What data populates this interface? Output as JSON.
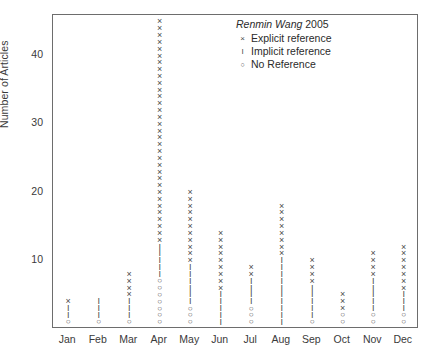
{
  "chart_data": {
    "type": "scatter",
    "title": "",
    "xlabel": "",
    "ylabel": "Number of Articles",
    "ylim": [
      0,
      46
    ],
    "yticks": [
      10,
      20,
      30,
      40
    ],
    "grid": false,
    "legend_position": "top-right",
    "legend": {
      "title_italic": "Renmin Wang",
      "title_year": "2005",
      "entries": [
        {
          "symbol": "x",
          "label": "Explicit reference"
        },
        {
          "symbol": "I",
          "label": "Implicit reference"
        },
        {
          "symbol": "o",
          "label": "No Reference"
        }
      ]
    },
    "categories": [
      "Jan",
      "Feb",
      "Mar",
      "Apr",
      "May",
      "Jun",
      "Jul",
      "Aug",
      "Sep",
      "Oct",
      "Nov",
      "Dec"
    ],
    "series": [
      {
        "name": "Explicit reference",
        "symbol": "x",
        "values": [
          1,
          0,
          4,
          33,
          11,
          9,
          4,
          9,
          4,
          3,
          4,
          8
        ]
      },
      {
        "name": "Implicit reference",
        "symbol": "I",
        "values": [
          2,
          3,
          3,
          5,
          6,
          5,
          4,
          10,
          5,
          0,
          5,
          3
        ]
      },
      {
        "name": "No Reference",
        "symbol": "o",
        "values": [
          1,
          1,
          1,
          7,
          3,
          0,
          3,
          0,
          1,
          2,
          2,
          2
        ]
      }
    ],
    "stacks": {
      "Jan": [
        {
          "v": 1,
          "s": "o"
        },
        {
          "v": 2,
          "s": "I"
        },
        {
          "v": 3,
          "s": "I"
        },
        {
          "v": 4,
          "s": "x"
        }
      ],
      "Feb": [
        {
          "v": 1,
          "s": "o"
        },
        {
          "v": 2,
          "s": "I"
        },
        {
          "v": 3,
          "s": "I"
        },
        {
          "v": 4,
          "s": "I"
        }
      ],
      "Mar": [
        {
          "v": 1,
          "s": "o"
        },
        {
          "v": 2,
          "s": "I"
        },
        {
          "v": 3,
          "s": "I"
        },
        {
          "v": 4,
          "s": "I"
        },
        {
          "v": 5,
          "s": "x"
        },
        {
          "v": 6,
          "s": "x"
        },
        {
          "v": 7,
          "s": "x"
        },
        {
          "v": 8,
          "s": "x"
        }
      ],
      "Apr": [
        {
          "v": 1,
          "s": "o"
        },
        {
          "v": 2,
          "s": "o"
        },
        {
          "v": 3,
          "s": "o"
        },
        {
          "v": 4,
          "s": "o"
        },
        {
          "v": 5,
          "s": "o"
        },
        {
          "v": 6,
          "s": "o"
        },
        {
          "v": 7,
          "s": "o"
        },
        {
          "v": 8,
          "s": "I"
        },
        {
          "v": 9,
          "s": "I"
        },
        {
          "v": 10,
          "s": "I"
        },
        {
          "v": 11,
          "s": "I"
        },
        {
          "v": 12,
          "s": "I"
        },
        {
          "v": 13,
          "s": "x"
        },
        {
          "v": 14,
          "s": "x"
        },
        {
          "v": 15,
          "s": "x"
        },
        {
          "v": 16,
          "s": "x"
        },
        {
          "v": 17,
          "s": "x"
        },
        {
          "v": 18,
          "s": "x"
        },
        {
          "v": 19,
          "s": "x"
        },
        {
          "v": 20,
          "s": "x"
        },
        {
          "v": 21,
          "s": "x"
        },
        {
          "v": 22,
          "s": "x"
        },
        {
          "v": 23,
          "s": "x"
        },
        {
          "v": 24,
          "s": "x"
        },
        {
          "v": 25,
          "s": "x"
        },
        {
          "v": 26,
          "s": "x"
        },
        {
          "v": 27,
          "s": "x"
        },
        {
          "v": 28,
          "s": "x"
        },
        {
          "v": 29,
          "s": "x"
        },
        {
          "v": 30,
          "s": "x"
        },
        {
          "v": 31,
          "s": "x"
        },
        {
          "v": 32,
          "s": "x"
        },
        {
          "v": 33,
          "s": "x"
        },
        {
          "v": 34,
          "s": "x"
        },
        {
          "v": 35,
          "s": "x"
        },
        {
          "v": 36,
          "s": "x"
        },
        {
          "v": 37,
          "s": "x"
        },
        {
          "v": 38,
          "s": "x"
        },
        {
          "v": 39,
          "s": "x"
        },
        {
          "v": 40,
          "s": "x"
        },
        {
          "v": 41,
          "s": "x"
        },
        {
          "v": 42,
          "s": "x"
        },
        {
          "v": 43,
          "s": "x"
        },
        {
          "v": 44,
          "s": "x"
        },
        {
          "v": 45,
          "s": "x"
        }
      ],
      "May": [
        {
          "v": 1,
          "s": "o"
        },
        {
          "v": 2,
          "s": "o"
        },
        {
          "v": 3,
          "s": "o"
        },
        {
          "v": 4,
          "s": "I"
        },
        {
          "v": 5,
          "s": "I"
        },
        {
          "v": 6,
          "s": "I"
        },
        {
          "v": 7,
          "s": "I"
        },
        {
          "v": 8,
          "s": "I"
        },
        {
          "v": 9,
          "s": "I"
        },
        {
          "v": 10,
          "s": "x"
        },
        {
          "v": 11,
          "s": "x"
        },
        {
          "v": 12,
          "s": "x"
        },
        {
          "v": 13,
          "s": "x"
        },
        {
          "v": 14,
          "s": "x"
        },
        {
          "v": 15,
          "s": "x"
        },
        {
          "v": 16,
          "s": "x"
        },
        {
          "v": 17,
          "s": "x"
        },
        {
          "v": 18,
          "s": "x"
        },
        {
          "v": 19,
          "s": "x"
        },
        {
          "v": 20,
          "s": "x"
        }
      ],
      "Jun": [
        {
          "v": 1,
          "s": "I"
        },
        {
          "v": 2,
          "s": "I"
        },
        {
          "v": 3,
          "s": "I"
        },
        {
          "v": 4,
          "s": "I"
        },
        {
          "v": 5,
          "s": "I"
        },
        {
          "v": 6,
          "s": "x"
        },
        {
          "v": 7,
          "s": "x"
        },
        {
          "v": 8,
          "s": "x"
        },
        {
          "v": 9,
          "s": "x"
        },
        {
          "v": 10,
          "s": "x"
        },
        {
          "v": 11,
          "s": "x"
        },
        {
          "v": 12,
          "s": "x"
        },
        {
          "v": 13,
          "s": "x"
        },
        {
          "v": 14,
          "s": "x"
        }
      ],
      "Jul": [
        {
          "v": 1,
          "s": "o"
        },
        {
          "v": 2,
          "s": "o"
        },
        {
          "v": 3,
          "s": "o"
        },
        {
          "v": 4,
          "s": "I"
        },
        {
          "v": 5,
          "s": "I"
        },
        {
          "v": 6,
          "s": "I"
        },
        {
          "v": 7,
          "s": "I"
        },
        {
          "v": 8,
          "s": "x"
        },
        {
          "v": 9,
          "s": "x"
        }
      ],
      "Aug": [
        {
          "v": 1,
          "s": "I"
        },
        {
          "v": 2,
          "s": "I"
        },
        {
          "v": 3,
          "s": "I"
        },
        {
          "v": 4,
          "s": "I"
        },
        {
          "v": 5,
          "s": "I"
        },
        {
          "v": 6,
          "s": "I"
        },
        {
          "v": 7,
          "s": "I"
        },
        {
          "v": 8,
          "s": "I"
        },
        {
          "v": 9,
          "s": "I"
        },
        {
          "v": 10,
          "s": "I"
        },
        {
          "v": 11,
          "s": "x"
        },
        {
          "v": 12,
          "s": "x"
        },
        {
          "v": 13,
          "s": "x"
        },
        {
          "v": 14,
          "s": "x"
        },
        {
          "v": 15,
          "s": "x"
        },
        {
          "v": 16,
          "s": "x"
        },
        {
          "v": 17,
          "s": "x"
        },
        {
          "v": 18,
          "s": "x"
        }
      ],
      "Sep": [
        {
          "v": 1,
          "s": "o"
        },
        {
          "v": 2,
          "s": "I"
        },
        {
          "v": 3,
          "s": "I"
        },
        {
          "v": 4,
          "s": "I"
        },
        {
          "v": 5,
          "s": "I"
        },
        {
          "v": 6,
          "s": "I"
        },
        {
          "v": 7,
          "s": "x"
        },
        {
          "v": 8,
          "s": "x"
        },
        {
          "v": 9,
          "s": "x"
        },
        {
          "v": 10,
          "s": "x"
        }
      ],
      "Oct": [
        {
          "v": 1,
          "s": "o"
        },
        {
          "v": 2,
          "s": "o"
        },
        {
          "v": 3,
          "s": "x"
        },
        {
          "v": 4,
          "s": "x"
        },
        {
          "v": 5,
          "s": "x"
        }
      ],
      "Nov": [
        {
          "v": 1,
          "s": "o"
        },
        {
          "v": 2,
          "s": "o"
        },
        {
          "v": 3,
          "s": "I"
        },
        {
          "v": 4,
          "s": "I"
        },
        {
          "v": 5,
          "s": "I"
        },
        {
          "v": 6,
          "s": "I"
        },
        {
          "v": 7,
          "s": "I"
        },
        {
          "v": 8,
          "s": "x"
        },
        {
          "v": 9,
          "s": "x"
        },
        {
          "v": 10,
          "s": "x"
        },
        {
          "v": 11,
          "s": "x"
        }
      ],
      "Dec": [
        {
          "v": 1,
          "s": "o"
        },
        {
          "v": 2,
          "s": "o"
        },
        {
          "v": 3,
          "s": "I"
        },
        {
          "v": 4,
          "s": "I"
        },
        {
          "v": 5,
          "s": "I"
        },
        {
          "v": 6,
          "s": "x"
        },
        {
          "v": 7,
          "s": "x"
        },
        {
          "v": 8,
          "s": "x"
        },
        {
          "v": 9,
          "s": "x"
        },
        {
          "v": 10,
          "s": "x"
        },
        {
          "v": 11,
          "s": "x"
        },
        {
          "v": 12,
          "s": "x"
        }
      ]
    }
  },
  "symbols": {
    "x": "×",
    "I": "I",
    "o": "○"
  },
  "colors": {
    "marker": "#4a4a4a",
    "axis": "#6d6d6d",
    "text": "#3a3a3a",
    "background": "#ffffff"
  }
}
